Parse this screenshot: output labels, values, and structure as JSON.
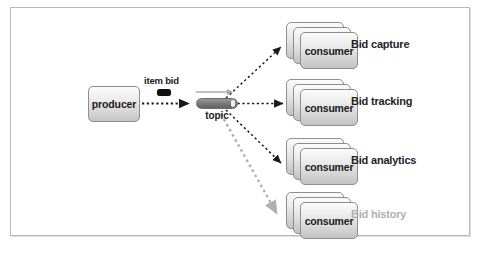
{
  "diagram": {
    "colors": {
      "ink": "#1b1b1b",
      "frame": "#b8b8b8",
      "wire_active": "#1a1a1a",
      "wire_inactive": "#b0b0b0",
      "pill_fill": "#7c7c7c",
      "marker": "#111111"
    },
    "producer": {
      "label": "producer"
    },
    "message": {
      "label": "item bid",
      "marker_name": "message-marker"
    },
    "topic": {
      "label": "topic",
      "arrow_name": "topic-flow-arrow"
    },
    "consumers": [
      {
        "node_label": "consumer",
        "caption": "Bid capture",
        "state": "active"
      },
      {
        "node_label": "consumer",
        "caption": "Bid tracking",
        "state": "active"
      },
      {
        "node_label": "consumer",
        "caption": "Bid analytics",
        "state": "active"
      },
      {
        "node_label": "consumer",
        "caption": "Bid history",
        "state": "inactive"
      }
    ]
  }
}
